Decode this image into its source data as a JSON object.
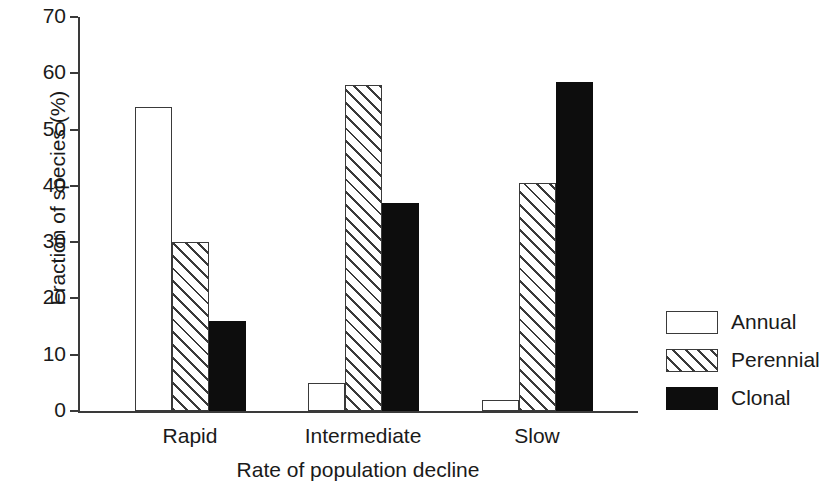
{
  "chart_data": {
    "type": "bar",
    "title": "",
    "xlabel": "Rate of population decline",
    "ylabel": "Fraction of species (%)",
    "categories": [
      "Rapid",
      "Intermediate",
      "Slow"
    ],
    "series": [
      {
        "name": "Annual",
        "values": [
          54,
          5,
          2
        ],
        "fill": "white"
      },
      {
        "name": "Perennial",
        "values": [
          30,
          58,
          40.5
        ],
        "fill": "hatched"
      },
      {
        "name": "Clonal",
        "values": [
          16,
          37,
          58.5
        ],
        "fill": "black"
      }
    ],
    "ylim": [
      0,
      70
    ],
    "yticks": [
      0,
      10,
      20,
      30,
      40,
      50,
      60,
      70
    ],
    "ytick_labels": [
      "0",
      "10",
      "20",
      "30",
      "40",
      "50",
      "60",
      "70"
    ],
    "grid": false,
    "legend_position": "right",
    "legend_entries": [
      "Annual",
      "Perennial",
      "Clonal"
    ],
    "colors": {
      "axis": "#3a3a3a",
      "text": "#1a1a1a",
      "annual": "#ffffff",
      "perennial_hatch": "#3a3a3a",
      "clonal": "#0d0d0d",
      "background": "#ffffff"
    }
  }
}
